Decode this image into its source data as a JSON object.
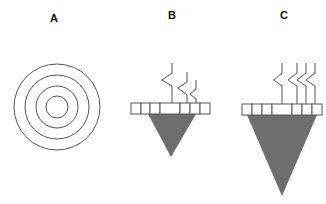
{
  "panels": [
    {
      "id": "A",
      "label": "A",
      "type": "concentric-circles",
      "center": [
        57,
        107
      ],
      "radii": [
        43,
        32,
        21,
        11
      ]
    },
    {
      "id": "B",
      "label": "B",
      "type": "receptor-array-with-cone",
      "boxes": {
        "y": 103,
        "height": 11,
        "edges": [
          131,
          141,
          150,
          160,
          180,
          190,
          200,
          210
        ]
      },
      "cone": {
        "top_left": [
          148,
          114
        ],
        "top_right": [
          196,
          114
        ],
        "tip": [
          171,
          157
        ]
      },
      "lines": 3
    },
    {
      "id": "C",
      "label": "C",
      "type": "receptor-array-with-cone",
      "boxes": {
        "y": 104,
        "height": 11,
        "edges": [
          242,
          252,
          262,
          272,
          292,
          302,
          312,
          322
        ]
      },
      "cone": {
        "top_left": [
          247,
          115
        ],
        "top_right": [
          317,
          115
        ],
        "tip": [
          282,
          196
        ]
      },
      "lines": 4
    }
  ],
  "colors": {
    "stroke": "#555555",
    "fill": "#6e6e6e",
    "label": "#111111"
  }
}
